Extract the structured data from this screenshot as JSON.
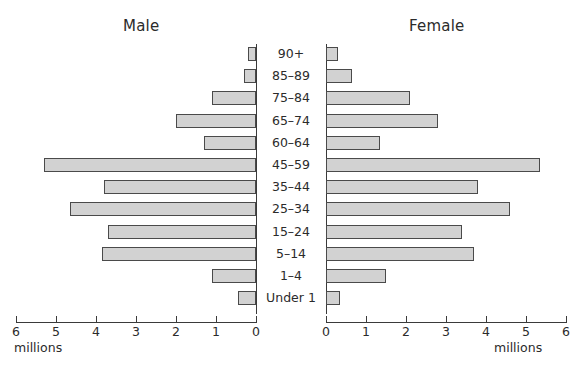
{
  "chart_data": {
    "type": "bar",
    "subtype": "population-pyramid",
    "title": "",
    "left_panel_label": "Male",
    "right_panel_label": "Female",
    "xlabel": "millions",
    "ylabel": "",
    "xlim": [
      0,
      6
    ],
    "xticks": [
      0,
      1,
      2,
      3,
      4,
      5,
      6
    ],
    "xtick_labels": [
      "0",
      "1",
      "2",
      "3",
      "4",
      "5",
      "6"
    ],
    "grid": false,
    "legend": "none",
    "categories": [
      "90+",
      "85–89",
      "75–84",
      "65–74",
      "60–64",
      "45–59",
      "35–44",
      "25–34",
      "15–24",
      "5–14",
      "1–4",
      "Under 1"
    ],
    "series": [
      {
        "name": "Male",
        "side": "left",
        "values": [
          0.2,
          0.3,
          1.1,
          2.0,
          1.3,
          5.3,
          3.8,
          4.65,
          3.7,
          3.85,
          1.1,
          0.45
        ]
      },
      {
        "name": "Female",
        "side": "right",
        "values": [
          0.3,
          0.65,
          2.1,
          2.8,
          1.35,
          5.35,
          3.8,
          4.6,
          3.4,
          3.7,
          1.5,
          0.35
        ]
      }
    ],
    "bar_fill_color": "#d2d2d2",
    "bar_border_color": "#4a4a4a",
    "axis_color": "#3a3a3a",
    "text_color": "#2b2b2b",
    "background_color": "#ffffff"
  },
  "axes": {
    "male_unit": "millions",
    "female_unit": "millions"
  }
}
